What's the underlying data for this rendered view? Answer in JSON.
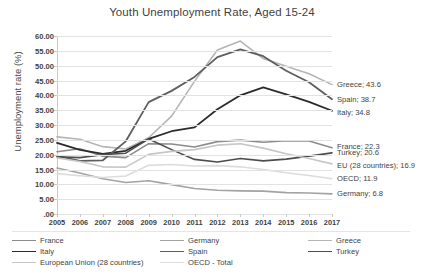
{
  "chart_data": {
    "type": "line",
    "title": "Youth Unemployment Rate, Aged 15-24",
    "xlabel": "",
    "ylabel": "Unemployment rate (%)",
    "ylim": [
      0,
      60
    ],
    "ytick_labels": [
      ".00",
      "5.00",
      "10.00",
      "15.00",
      "20.00",
      "25.00",
      "30.00",
      "35.00",
      "40.00",
      "45.00",
      "50.00",
      "55.00",
      "60.00"
    ],
    "ytick_values": [
      0,
      5,
      10,
      15,
      20,
      25,
      30,
      35,
      40,
      45,
      50,
      55,
      60
    ],
    "grid": true,
    "legend_position": "bottom",
    "categories": [
      "2005",
      "2006",
      "2007",
      "2008",
      "2009",
      "2010",
      "2011",
      "2012",
      "2013",
      "2014",
      "2015",
      "2016",
      "2017"
    ],
    "series": [
      {
        "name": "France",
        "color": "#8c8c8c",
        "width": 1.6,
        "values": [
          21.0,
          22.0,
          19.5,
          19.0,
          23.7,
          23.6,
          22.6,
          24.4,
          24.9,
          24.2,
          24.7,
          24.6,
          22.3
        ],
        "end_label": "France; 22.3"
      },
      {
        "name": "Germany",
        "color": "#a3a3a3",
        "width": 1.6,
        "values": [
          15.5,
          13.8,
          11.9,
          10.6,
          11.2,
          9.9,
          8.6,
          8.0,
          7.8,
          7.7,
          7.2,
          7.1,
          6.8
        ],
        "end_label": "Germany; 6.8"
      },
      {
        "name": "Greece",
        "color": "#b5b5b5",
        "width": 1.6,
        "values": [
          26.0,
          25.2,
          22.7,
          21.9,
          25.7,
          33.0,
          44.7,
          55.3,
          58.3,
          52.4,
          49.8,
          47.3,
          43.6
        ],
        "end_label": "Greece; 43.6"
      },
      {
        "name": "Italy",
        "color": "#2b2b2b",
        "width": 1.8,
        "values": [
          24.0,
          21.6,
          20.3,
          21.3,
          25.3,
          27.9,
          29.2,
          35.3,
          40.0,
          42.7,
          40.3,
          37.8,
          34.8
        ],
        "end_label": "Italy; 34.8"
      },
      {
        "name": "Spain",
        "color": "#5e5e5e",
        "width": 1.8,
        "values": [
          19.6,
          17.9,
          18.1,
          24.5,
          37.7,
          41.5,
          46.2,
          52.9,
          55.5,
          53.2,
          48.3,
          44.4,
          38.7
        ],
        "end_label": "Spain; 38.7"
      },
      {
        "name": "Turkey",
        "color": "#4d4d4d",
        "width": 1.6,
        "values": [
          19.3,
          19.0,
          20.0,
          20.5,
          25.3,
          21.7,
          18.4,
          17.5,
          18.7,
          17.9,
          18.5,
          19.5,
          20.6
        ],
        "end_label": "Turkey; 20.6"
      },
      {
        "name": "European Union (28 countries)",
        "color": "#c6c6c6",
        "width": 1.6,
        "values": [
          18.9,
          17.7,
          15.9,
          15.8,
          20.1,
          21.1,
          21.7,
          23.2,
          23.7,
          22.2,
          20.3,
          18.7,
          16.9
        ],
        "end_label": "EU (28 countries); 16.9"
      },
      {
        "name": "OECD - Total",
        "color": "#dcdcdc",
        "width": 1.6,
        "values": [
          13.6,
          12.9,
          12.3,
          12.8,
          16.4,
          16.7,
          16.2,
          16.3,
          15.9,
          15.0,
          13.9,
          13.0,
          11.9
        ],
        "end_label": "OECD; 11.9"
      }
    ],
    "end_labels": [
      {
        "text": "Greece; 43.6",
        "value": 43.6
      },
      {
        "text": "Spain; 38.7",
        "value": 38.7
      },
      {
        "text": "Italy; 34.8",
        "value": 34.8
      },
      {
        "text": "France; 22.3",
        "value": 22.3
      },
      {
        "text": "Turkey; 20.6",
        "value": 20.6
      },
      {
        "text": "EU (28 countries); 16.9",
        "value": 16.9
      },
      {
        "text": "OECD; 11.9",
        "value": 11.9
      },
      {
        "text": "Germany; 6.8",
        "value": 6.8
      }
    ],
    "legend": [
      {
        "label": "France",
        "color": "#8c8c8c",
        "width": 1.6,
        "col": 0,
        "row": 0
      },
      {
        "label": "Germany",
        "color": "#a3a3a3",
        "width": 1.6,
        "col": 1,
        "row": 0
      },
      {
        "label": "Greece",
        "color": "#b5b5b5",
        "width": 1.6,
        "col": 2,
        "row": 0
      },
      {
        "label": "Italy",
        "color": "#2b2b2b",
        "width": 1.8,
        "col": 0,
        "row": 1
      },
      {
        "label": "Spain",
        "color": "#5e5e5e",
        "width": 1.8,
        "col": 1,
        "row": 1
      },
      {
        "label": "Turkey",
        "color": "#4d4d4d",
        "width": 1.6,
        "col": 2,
        "row": 1
      },
      {
        "label": "European Union (28 countries)",
        "color": "#c6c6c6",
        "width": 1.6,
        "col": 0,
        "row": 2
      },
      {
        "label": "OECD - Total",
        "color": "#dcdcdc",
        "width": 1.6,
        "col": 1,
        "row": 2
      }
    ]
  }
}
